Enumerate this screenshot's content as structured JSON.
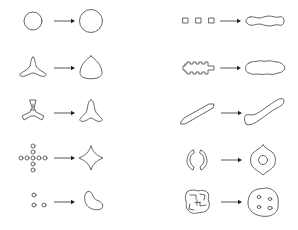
{
  "diagram": {
    "type": "shape-transformation-pairs",
    "stroke_color": "#555555",
    "background": "#ffffff",
    "columns": [
      {
        "name": "left",
        "rows": [
          {
            "from": "small circle",
            "to": "larger circle"
          },
          {
            "from": "three-armed star (tripod)",
            "to": "rounded triangle (Reuleaux-like)"
          },
          {
            "from": "three-bladed propeller with notched arms",
            "to": "smooth three-armed star"
          },
          {
            "from": "cross of small circles (dots)",
            "to": "four-pointed concave star"
          },
          {
            "from": "three small circles",
            "to": "kidney/bean shape"
          }
        ]
      },
      {
        "name": "right",
        "rows": [
          {
            "from": "three small squares in a row",
            "to": "elongated wavy blob (dumbbell)"
          },
          {
            "from": "comb / crenellated bar",
            "to": "cloud-like wavy blob"
          },
          {
            "from": "thin slanted bar",
            "to": "smooth elongated club shape"
          },
          {
            "from": "two facing C-shaped arcs",
            "to": "lemon shape with inner circular hole"
          },
          {
            "from": "complex interlocked pinwheel shape",
            "to": "rounded blob with four small holes"
          }
        ]
      }
    ]
  }
}
